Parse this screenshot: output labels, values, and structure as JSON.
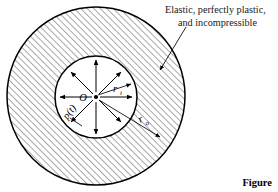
{
  "figure": {
    "caption": "Figure",
    "callout": {
      "line1": "Elastic, perfectly plastic,",
      "line2": "and incompressible"
    },
    "labels": {
      "center": "O",
      "inner_radius_symbol": "r",
      "inner_radius_subscript": "i",
      "outer_radius_symbol": "r",
      "outer_radius_subscript": "o",
      "pressure": "p(t)"
    },
    "colors": {
      "ink": "#000000",
      "hatch": "#1a1a1a",
      "background": "#ffffff",
      "text": "#1a1a1a"
    },
    "geometry": {
      "outer_center_x": 96,
      "outer_center_y": 96,
      "outer_radius": 89,
      "inner_center_x": 96,
      "inner_center_y": 97,
      "inner_radius": 41,
      "hatch_angle_deg": 45,
      "hatch_spacing": 4.6,
      "arrow_count": 8
    }
  }
}
